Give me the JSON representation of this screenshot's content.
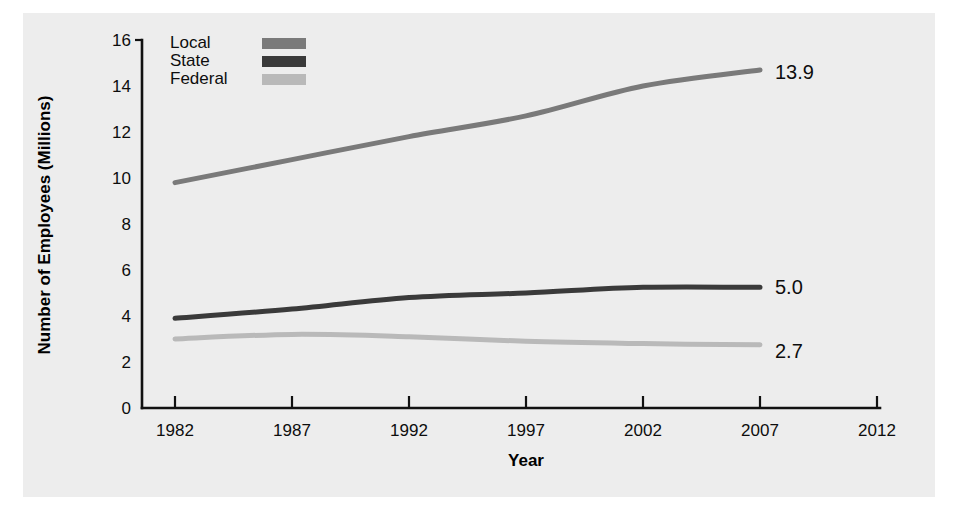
{
  "figure": {
    "background_color": "#ededed",
    "page_color": "#ffffff"
  },
  "chart_data": {
    "type": "line",
    "title": "",
    "xlabel": "Year",
    "ylabel": "Number of Employees (Millions)",
    "x": [
      1982,
      1987,
      1992,
      1997,
      2002,
      2007
    ],
    "xlim": [
      1980,
      2013
    ],
    "ylim": [
      0,
      16
    ],
    "xticks": [
      "1982",
      "1987",
      "1992",
      "1997",
      "2002",
      "2007",
      "2012"
    ],
    "xtick_values": [
      1982,
      1987,
      1992,
      1997,
      2002,
      2007,
      2012
    ],
    "yticks": [
      "0",
      "2",
      "4",
      "6",
      "8",
      "10",
      "12",
      "14",
      "16"
    ],
    "ytick_values": [
      0,
      2,
      4,
      6,
      8,
      10,
      12,
      14,
      16
    ],
    "grid": false,
    "legend_position": "top-left-inside",
    "series": [
      {
        "name": "Local",
        "color": "#7a7a7a",
        "values": [
          9.8,
          10.8,
          11.8,
          12.7,
          14.0,
          14.7
        ],
        "end_label": "13.9"
      },
      {
        "name": "State",
        "color": "#3a3a3a",
        "values": [
          3.9,
          4.3,
          4.8,
          5.0,
          5.25,
          5.25
        ],
        "end_label": "5.0"
      },
      {
        "name": "Federal",
        "color": "#b9b9b9",
        "values": [
          3.0,
          3.2,
          3.1,
          2.9,
          2.8,
          2.75
        ],
        "end_label": "2.7"
      }
    ]
  },
  "legend": {
    "items": [
      {
        "label": "Local",
        "color": "#7a7a7a"
      },
      {
        "label": "State",
        "color": "#3a3a3a"
      },
      {
        "label": "Federal",
        "color": "#b9b9b9"
      }
    ]
  },
  "axis_titles": {
    "x": "Year",
    "y": "Number of Employees (Millions)"
  },
  "end_labels": {
    "local": "13.9",
    "state": "5.0",
    "federal": "2.7"
  },
  "ticks": {
    "y": [
      "16",
      "14",
      "12",
      "10",
      "8",
      "6",
      "4",
      "2",
      "0"
    ],
    "x": [
      "1982",
      "1987",
      "1992",
      "1997",
      "2002",
      "2007",
      "2012"
    ]
  }
}
